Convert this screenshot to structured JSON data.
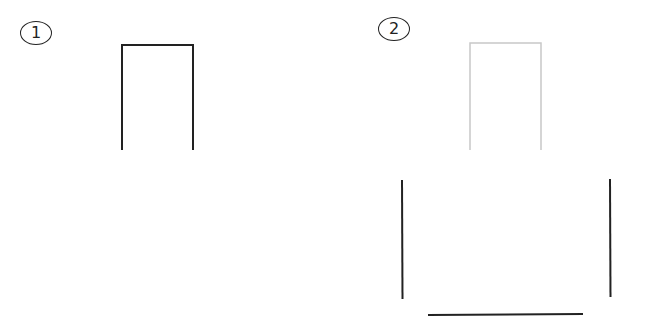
{
  "panels": [
    {
      "label": "1",
      "description": "Open-bottom rectangle (door outline), dark"
    },
    {
      "label": "2",
      "description": "Light gray open-bottom rectangle above two vertical lines and a bottom horizontal line"
    }
  ],
  "colors": {
    "dark_stroke": "#222222",
    "light_stroke": "#c8c8c8",
    "background": "#ffffff"
  }
}
